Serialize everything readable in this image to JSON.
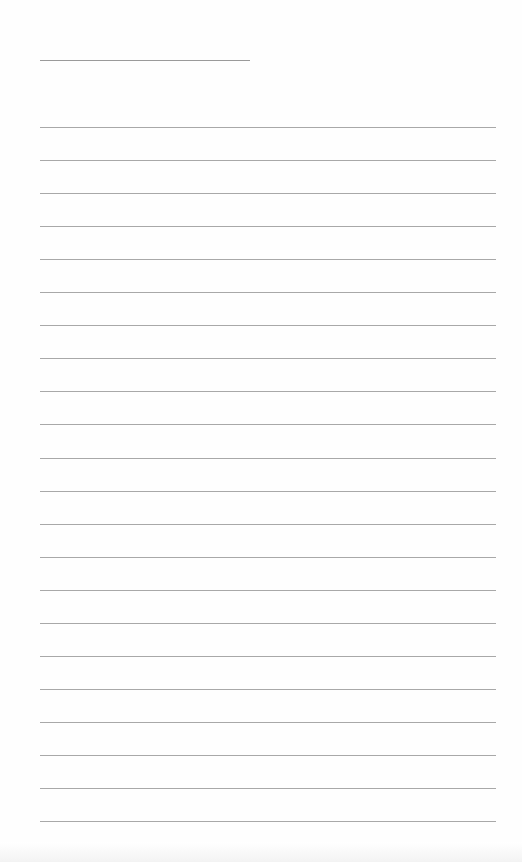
{
  "document": {
    "type": "lined-paper",
    "title_line": {
      "present": true
    },
    "ruled_lines": {
      "count": 22,
      "first_y": 127,
      "spacing": 33.05
    },
    "colors": {
      "paper": "#fefefe",
      "rule": "#a8a8a8",
      "title_rule": "#9a9a9a"
    }
  }
}
